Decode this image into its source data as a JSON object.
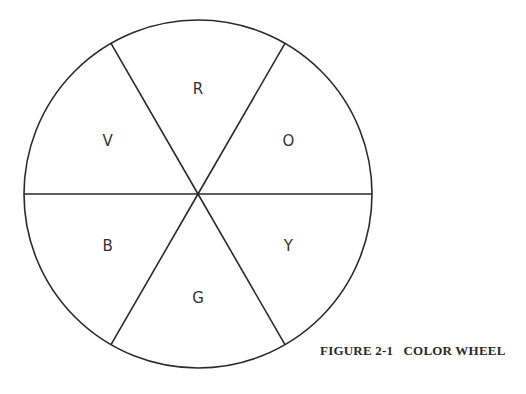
{
  "figure": {
    "caption": "FIGURE 2-1   COLOR WHEEL"
  },
  "wheel": {
    "segments": [
      {
        "key": "red",
        "label": "R"
      },
      {
        "key": "orange",
        "label": "O"
      },
      {
        "key": "yellow",
        "label": "Y"
      },
      {
        "key": "green",
        "label": "G"
      },
      {
        "key": "blue",
        "label": "B"
      },
      {
        "key": "violet",
        "label": "V"
      }
    ]
  }
}
